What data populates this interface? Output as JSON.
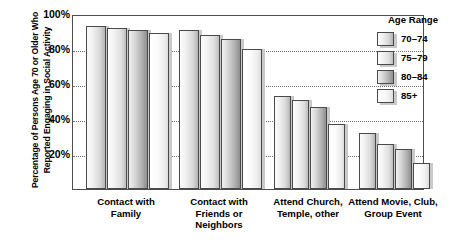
{
  "chart_data": {
    "type": "bar",
    "title": "",
    "xlabel": "",
    "ylabel": "Percentage of Persons Age 70 or Older Who Reported Engaging in Social Activity",
    "ylabel_lines": [
      "Percentage of Persons Age 70 or Older Who",
      "Reported Engaging in Social Activity"
    ],
    "ylim": [
      0,
      100
    ],
    "ytick_labels": [
      "20%",
      "40%",
      "60%",
      "80%",
      "100%"
    ],
    "ytick_values": [
      20,
      40,
      60,
      80,
      100
    ],
    "grid": true,
    "grid_axis": "y",
    "legend_position": "right",
    "legend_title": "Age Range",
    "categories": [
      "Contact with Family",
      "Contact with Friends or Neighbors",
      "Attend Church, Temple, other",
      "Attend Movie, Club, Group Event"
    ],
    "category_lines": [
      [
        "Contact with",
        "Family"
      ],
      [
        "Contact with",
        "Friends or",
        "Neighbors"
      ],
      [
        "Attend Church,",
        "Temple, other"
      ],
      [
        "Attend Movie, Club,",
        "Group Event"
      ]
    ],
    "series": [
      {
        "name": "70–74",
        "values": [
          93,
          91,
          53,
          32
        ]
      },
      {
        "name": "75–79",
        "values": [
          92,
          88,
          51,
          26
        ]
      },
      {
        "name": "80–84",
        "values": [
          91,
          86,
          47,
          23
        ]
      },
      {
        "name": "85+",
        "values": [
          89,
          80,
          37,
          15
        ]
      }
    ]
  }
}
